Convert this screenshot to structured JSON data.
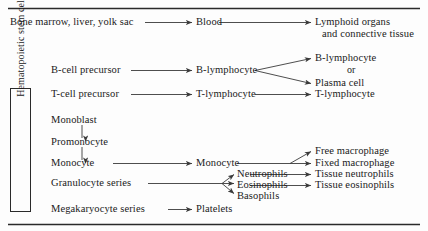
{
  "figure": {
    "type": "flow-diagram",
    "background_color": "#fdfdfd",
    "line_color": "#3a3a3a",
    "text_color": "#1a1a1a"
  },
  "rules": {
    "top_rule": "",
    "bottom_rule": ""
  },
  "stem_box": {
    "label": "Hematopoietic stem cell",
    "orientation": "vertical-rotated-90ccw"
  },
  "nodes": {
    "origin": "Bone marrow, liver, yolk sac",
    "blood": "Blood",
    "lymphoid_organs_line1": "Lymphoid organs",
    "lymphoid_organs_line2": "and connective tissue",
    "b_cell_precursor": "B-cell precursor",
    "b_lymphocyte_mid": "B-lymphocyte",
    "b_lymphocyte_end": "B-lymphocyte",
    "or_label": "or",
    "plasma_cell": "Plasma cell",
    "t_cell_precursor": "T-cell precursor",
    "t_lymphocyte_mid": "T-lymphocyte",
    "t_lymphocyte_end": "T-lymphocyte",
    "monoblast": "Monoblast",
    "promonocyte": "Promonocyte",
    "monocyte_left": "Monocyte",
    "monocyte_mid": "Monocyte",
    "free_macrophage": "Free macrophage",
    "fixed_macrophage": "Fixed macrophage",
    "granulocyte_series": "Granulocyte series",
    "neutrophils": "Neutrophils",
    "eosinophils": "Eosinophils",
    "basophils": "Basophils",
    "tissue_neutrophils": "Tissue neutrophils",
    "tissue_eosinophils": "Tissue eosinophils",
    "megakaryocyte_series": "Megakaryocyte series",
    "platelets": "Platelets"
  }
}
